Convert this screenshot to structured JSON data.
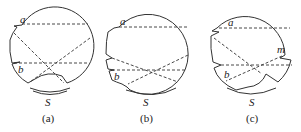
{
  "figure": {
    "panels": [
      {
        "id": "a",
        "caption": "(a)",
        "labels": {
          "top_point": "a",
          "bottom_point": "b",
          "source": "S"
        }
      },
      {
        "id": "b",
        "caption": "(b)",
        "labels": {
          "top_point": "a",
          "bottom_point": "b",
          "source": "S"
        }
      },
      {
        "id": "c",
        "caption": "(c)",
        "labels": {
          "top_point": "a",
          "bottom_point": "b",
          "side_point": "m",
          "source": "S"
        }
      }
    ]
  }
}
